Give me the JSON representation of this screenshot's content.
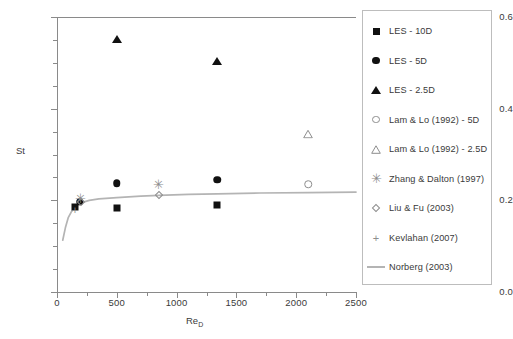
{
  "chart_data": {
    "type": "scatter",
    "title": "",
    "xlabel": "Re_D",
    "xlabel_base": "Re",
    "xlabel_sub": "D",
    "ylabel": "St",
    "xlim": [
      0,
      2500
    ],
    "ylim": [
      0.0,
      0.6
    ],
    "xticks": [
      0,
      500,
      1000,
      1500,
      2000,
      2500
    ],
    "xtick_labels": [
      "0",
      "500",
      "1000",
      "1500",
      "2000",
      "2500"
    ],
    "xminor_step": 250,
    "yticks": [
      0.0,
      0.2,
      0.4,
      0.6
    ],
    "ytick_labels": [
      "0.0",
      "0.2",
      "0.4",
      "0.6"
    ],
    "yminor_step": 0.05,
    "grid": false,
    "legend_position": "right-outside",
    "series": [
      {
        "name": "LES - 10D",
        "marker": "filled-square",
        "color": "#111111",
        "points": [
          {
            "x": 150,
            "y": 0.185
          },
          {
            "x": 500,
            "y": 0.183
          },
          {
            "x": 1340,
            "y": 0.19
          }
        ]
      },
      {
        "name": "LES - 5D",
        "marker": "filled-circle",
        "color": "#111111",
        "points": [
          {
            "x": 190,
            "y": 0.197
          },
          {
            "x": 500,
            "y": 0.237
          },
          {
            "x": 1340,
            "y": 0.245
          }
        ]
      },
      {
        "name": "LES - 2.5D",
        "marker": "filled-triangle",
        "color": "#111111",
        "points": [
          {
            "x": 500,
            "y": 0.551
          },
          {
            "x": 1340,
            "y": 0.505
          }
        ]
      },
      {
        "name": "Lam & Lo (1992) - 5D",
        "marker": "open-circle",
        "color": "#8d8d8d",
        "points": [
          {
            "x": 2100,
            "y": 0.235
          }
        ]
      },
      {
        "name": "Lam & Lo (1992) - 2.5D",
        "marker": "open-triangle",
        "color": "#8d8d8d",
        "points": [
          {
            "x": 2100,
            "y": 0.345
          }
        ]
      },
      {
        "name": "Zhang & Dalton (1997)",
        "marker": "asterisk",
        "color": "#8d8d8d",
        "points": [
          {
            "x": 200,
            "y": 0.205
          },
          {
            "x": 850,
            "y": 0.235
          }
        ]
      },
      {
        "name": "Liu & Fu (2003)",
        "marker": "open-diamond",
        "color": "#8d8d8d",
        "points": [
          {
            "x": 200,
            "y": 0.196
          },
          {
            "x": 850,
            "y": 0.212
          }
        ]
      },
      {
        "name": "Kevlahan (2007)",
        "marker": "plus",
        "color": "#8d8d8d",
        "points": [
          {
            "x": 150,
            "y": 0.18
          }
        ]
      },
      {
        "name": "Norberg (2003)",
        "marker": "line",
        "color": "#b4b4b4",
        "curve": [
          {
            "x": 48,
            "y": 0.113
          },
          {
            "x": 70,
            "y": 0.14
          },
          {
            "x": 95,
            "y": 0.163
          },
          {
            "x": 120,
            "y": 0.175
          },
          {
            "x": 150,
            "y": 0.184
          },
          {
            "x": 180,
            "y": 0.19
          },
          {
            "x": 220,
            "y": 0.196
          },
          {
            "x": 270,
            "y": 0.2
          },
          {
            "x": 350,
            "y": 0.203
          },
          {
            "x": 500,
            "y": 0.206
          },
          {
            "x": 700,
            "y": 0.209
          },
          {
            "x": 850,
            "y": 0.211
          },
          {
            "x": 1100,
            "y": 0.213
          },
          {
            "x": 1340,
            "y": 0.214
          },
          {
            "x": 1700,
            "y": 0.216
          },
          {
            "x": 2100,
            "y": 0.217
          },
          {
            "x": 2500,
            "y": 0.218
          }
        ]
      }
    ]
  },
  "legend": {
    "items": [
      {
        "label": "LES - 10D",
        "marker": "filled-square"
      },
      {
        "label": "LES - 5D",
        "marker": "filled-circle"
      },
      {
        "label": "LES - 2.5D",
        "marker": "filled-triangle"
      },
      {
        "label": "Lam & Lo (1992) - 5D",
        "marker": "open-circle"
      },
      {
        "label": "Lam & Lo (1992) - 2.5D",
        "marker": "open-triangle"
      },
      {
        "label": "Zhang & Dalton (1997)",
        "marker": "asterisk"
      },
      {
        "label": "Liu & Fu (2003)",
        "marker": "open-diamond"
      },
      {
        "label": "Kevlahan (2007)",
        "marker": "plus"
      },
      {
        "label": "Norberg (2003)",
        "marker": "line"
      }
    ]
  }
}
